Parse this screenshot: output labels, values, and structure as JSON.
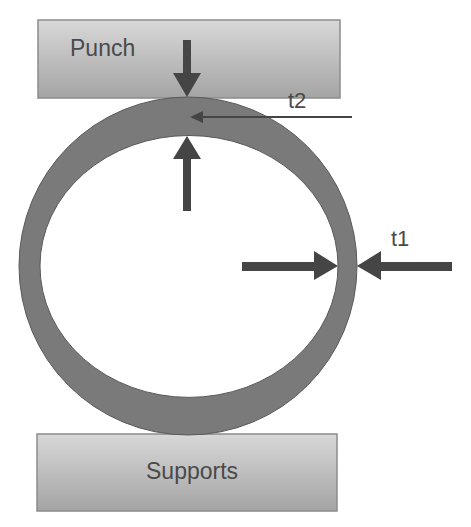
{
  "diagram": {
    "punch": {
      "label": "Punch"
    },
    "supports": {
      "label": "Supports"
    },
    "dimensions": [
      {
        "id": "t2",
        "label": "t2",
        "location": "top wall thickness"
      },
      {
        "id": "t1",
        "label": "t1",
        "location": "right wall thickness"
      }
    ],
    "colors": {
      "ring": "#7a7a7a",
      "plate_top": "#d6d6d6",
      "plate_bottom": "#a6a6a6",
      "arrow": "#454545",
      "text": "#4a4a4a"
    }
  }
}
